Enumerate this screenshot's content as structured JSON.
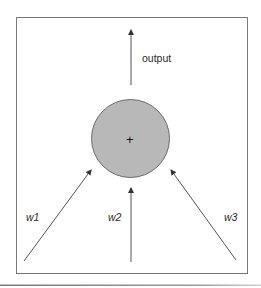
{
  "diagram": {
    "type": "perceptron-summation-node",
    "node": {
      "symbol": "+",
      "fill": "#b8b8b8",
      "stroke": "#6a6a6a",
      "cx": 130.5,
      "cy": 138.5,
      "r": 39
    },
    "output": {
      "label": "output",
      "arrow": {
        "x1": 131,
        "y1": 85,
        "x2": 131,
        "y2": 30
      }
    },
    "inputs": [
      {
        "label": "w1",
        "arrow": {
          "x1": 24,
          "y1": 261,
          "x2": 91,
          "y2": 170
        }
      },
      {
        "label": "w2",
        "arrow": {
          "x1": 131,
          "y1": 262,
          "x2": 131,
          "y2": 188
        }
      },
      {
        "label": "w3",
        "arrow": {
          "x1": 236,
          "y1": 260,
          "x2": 171,
          "y2": 170
        }
      }
    ],
    "colors": {
      "frame": "#777777",
      "arrow": "#555555",
      "text": "#2a2a2a",
      "separator": "#888888"
    }
  }
}
